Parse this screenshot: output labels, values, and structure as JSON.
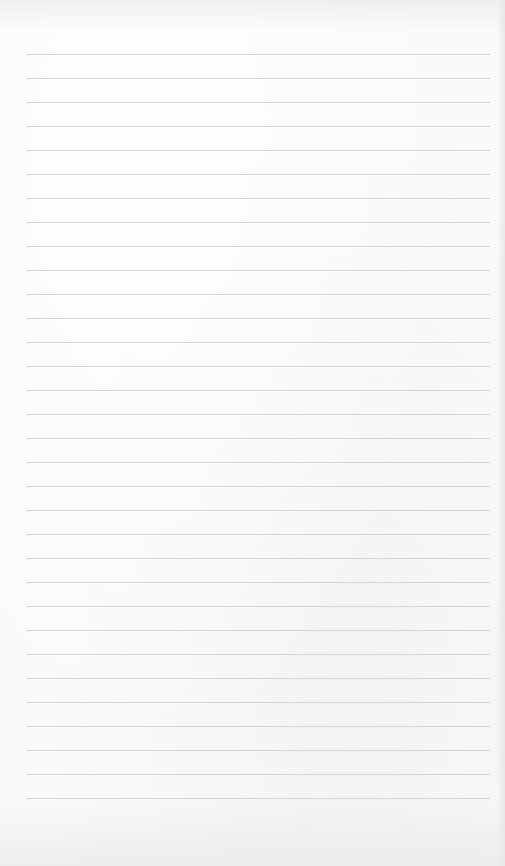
{
  "page": {
    "type": "blank lined paper",
    "paper_color": "#fafaf9",
    "line_color": "#d4d4d2",
    "line_count": 32,
    "first_line_y": 54,
    "line_spacing": 24,
    "line_left": 26,
    "line_width": 464
  }
}
